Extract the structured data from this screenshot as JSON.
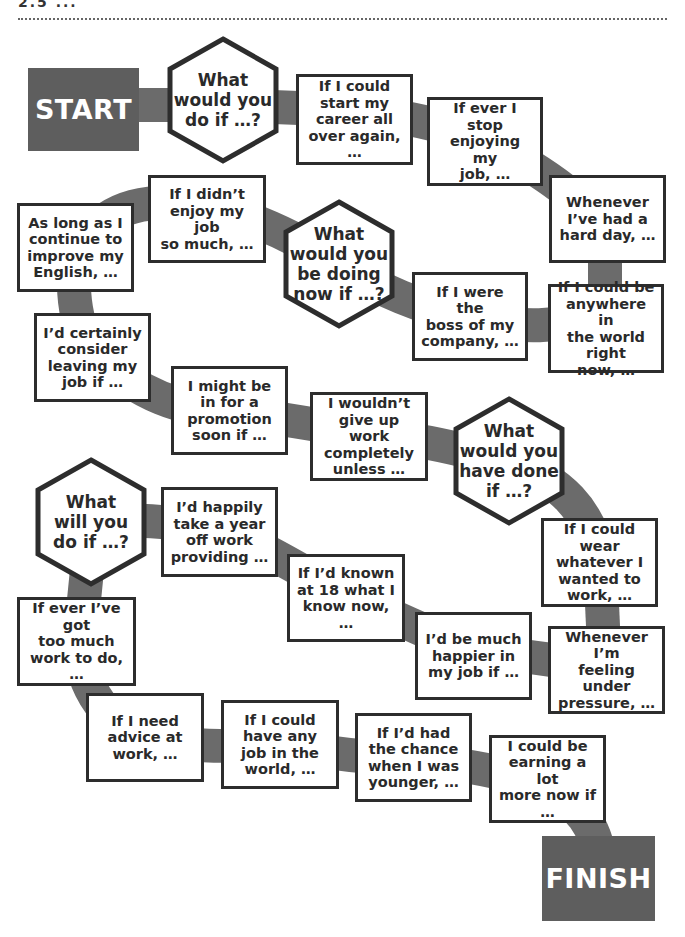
{
  "header": {
    "partial_text": "2.5 ..."
  },
  "colors": {
    "track": "#6b6b6b",
    "terminal_bg": "#5e5e5e",
    "border": "#2d2d2d",
    "text": "#2a2a2a"
  },
  "start": {
    "label": "START"
  },
  "finish": {
    "label": "FINISH"
  },
  "hexagons": [
    {
      "label": "What\nwould you\ndo if …?"
    },
    {
      "label": "What\nwould you\nbe doing\nnow if …?"
    },
    {
      "label": "What\nwould you\nhave done\nif …?"
    },
    {
      "label": "What\nwill you\ndo if …?"
    }
  ],
  "squares": [
    {
      "label": "If I could\nstart my\ncareer all\nover again, …"
    },
    {
      "label": "If ever I stop\nenjoying my\njob, …"
    },
    {
      "label": "Whenever\nI’ve had a\nhard day, …"
    },
    {
      "label": "If I didn’t\nenjoy my job\nso much, …"
    },
    {
      "label": "As long as I\ncontinue to\nimprove my\nEnglish, …"
    },
    {
      "label": "If I were the\nboss of my\ncompany, …"
    },
    {
      "label": "If I could be\nanywhere in\nthe world right\nnow, …"
    },
    {
      "label": "I’d certainly\nconsider\nleaving my\njob if …"
    },
    {
      "label": "I might be\nin for a\npromotion\nsoon if …"
    },
    {
      "label": "I wouldn’t\ngive up work\ncompletely\nunless …"
    },
    {
      "label": "I’d happily\ntake a year\noff work\nproviding …"
    },
    {
      "label": "If I’d known\nat 18 what I\nknow now, …"
    },
    {
      "label": "If I could wear\nwhatever I\nwanted to\nwork, …"
    },
    {
      "label": "If ever I’ve got\ntoo much\nwork to do, …"
    },
    {
      "label": "I’d be much\nhappier in\nmy job if …"
    },
    {
      "label": "Whenever I’m\nfeeling under\npressure, …"
    },
    {
      "label": "If I need\nadvice at\nwork, …"
    },
    {
      "label": "If I could\nhave any\njob in the\nworld, …"
    },
    {
      "label": "If I’d had\nthe chance\nwhen I was\nyounger, …"
    },
    {
      "label": "I could be\nearning a lot\nmore now if …"
    }
  ]
}
